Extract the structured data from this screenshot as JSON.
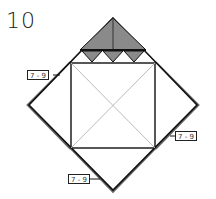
{
  "step_number": "10",
  "labels": [
    {
      "id": "left",
      "text": "7 - 9"
    },
    {
      "id": "right",
      "text": "7 - 9"
    },
    {
      "id": "bottom",
      "text": "7 - 9"
    }
  ],
  "colors": {
    "fill": "#8a8a8a",
    "line": "#111111",
    "thin": "#bbbbbb",
    "shadow": "#6a6a6a"
  }
}
